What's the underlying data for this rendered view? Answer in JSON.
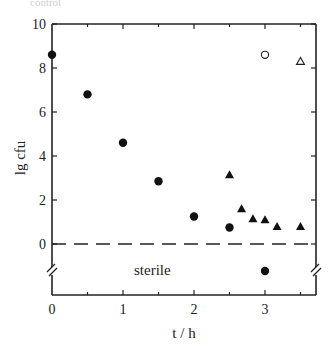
{
  "header": {
    "cut_text": "control"
  },
  "chart_data": {
    "type": "scatter",
    "title": "",
    "xlabel": "t / h",
    "ylabel": "lg cfu",
    "xlim": [
      0,
      3.7
    ],
    "ylim": [
      -1.5,
      10
    ],
    "grid": false,
    "x_ticks": [
      0,
      1,
      2,
      3
    ],
    "x_tick_labels": [
      "0",
      "1",
      "2",
      "3"
    ],
    "y_ticks": [
      0,
      2,
      4,
      6,
      8,
      10
    ],
    "y_tick_labels": [
      "0",
      "2",
      "4",
      "6",
      "8",
      "10"
    ],
    "reference_line": {
      "y": 0,
      "style": "dashed"
    },
    "axis_break": {
      "position": "below zero",
      "label": "sterile"
    },
    "series": [
      {
        "name": "filled circles",
        "marker": "circle-filled",
        "points": [
          {
            "x": 0.0,
            "y": 8.6
          },
          {
            "x": 0.5,
            "y": 6.8
          },
          {
            "x": 1.0,
            "y": 4.6
          },
          {
            "x": 1.5,
            "y": 2.85
          },
          {
            "x": 2.0,
            "y": 1.25
          },
          {
            "x": 2.5,
            "y": 0.75
          },
          {
            "x": 3.0,
            "y": "sterile"
          }
        ]
      },
      {
        "name": "filled triangles",
        "marker": "triangle-filled",
        "points": [
          {
            "x": 2.5,
            "y": 3.15
          },
          {
            "x": 2.67,
            "y": 1.6
          },
          {
            "x": 2.83,
            "y": 1.15
          },
          {
            "x": 3.0,
            "y": 1.1
          },
          {
            "x": 3.17,
            "y": 0.8
          },
          {
            "x": 3.5,
            "y": 0.8
          }
        ]
      },
      {
        "name": "open circle",
        "marker": "circle-open",
        "points": [
          {
            "x": 3.0,
            "y": 8.6
          }
        ]
      },
      {
        "name": "open triangle",
        "marker": "triangle-open",
        "points": [
          {
            "x": 3.5,
            "y": 8.3
          }
        ]
      }
    ]
  }
}
